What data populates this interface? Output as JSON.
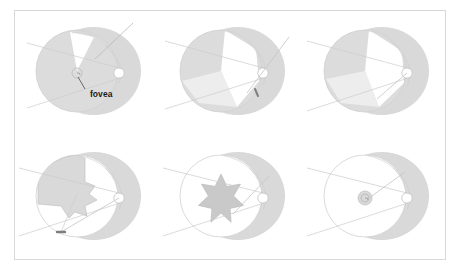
{
  "figure": {
    "caption_label": "",
    "border_color": "#d8d8d8",
    "background_color": "#ffffff",
    "panel_count": 6,
    "rows": 2,
    "columns": 3
  },
  "palette": {
    "globe_outline": "#cfcfcf",
    "shaded_fill": "#dcdcdc",
    "mid_fill": "#e8e8e8",
    "light_fill": "#f2f2f2",
    "white_fill": "#ffffff",
    "lens_outline": "#d0d0d0",
    "ray_line": "#cccccc",
    "dark_marker": "#8a8a8a",
    "label_text": "#1d1d1d"
  },
  "labels": {
    "fovea": "fovea"
  },
  "panels": [
    {
      "id": "panel-1",
      "name": "panel-top-left",
      "position": "top-left",
      "has_fovea_label": true,
      "fovea_label": "fovea",
      "shading": "full-globe-shaded",
      "defect_shape": "small-superior-wedge",
      "defect_fill": "#ffffff",
      "fovea_marker": "spiral-ring",
      "lens_marker": "small-circle-right",
      "ray_count": 3
    },
    {
      "id": "panel-2",
      "name": "panel-top-center",
      "position": "top-center",
      "has_fovea_label": false,
      "fovea_label": "",
      "shading": "partial-globe-shaded",
      "defect_shape": "large-central-wedge",
      "defect_fill": "#ffffff",
      "fovea_marker": "dark-dot",
      "lens_marker": "small-circle-right",
      "ray_count": 3
    },
    {
      "id": "panel-3",
      "name": "panel-top-right",
      "position": "top-right",
      "has_fovea_label": false,
      "fovea_label": "",
      "shading": "partial-globe-shaded",
      "defect_shape": "large-central-wedge",
      "defect_fill": "#ffffff",
      "fovea_marker": "none",
      "lens_marker": "small-circle-right",
      "ray_count": 2
    },
    {
      "id": "panel-4",
      "name": "panel-bottom-left",
      "position": "bottom-left",
      "has_fovea_label": false,
      "fovea_label": "",
      "shading": "upper-hemifield-shaded",
      "defect_shape": "star-notched-wedge",
      "defect_fill": "#dedede",
      "fovea_marker": "dark-dot-inferior",
      "lens_marker": "small-circle-right",
      "ray_count": 3
    },
    {
      "id": "panel-5",
      "name": "panel-bottom-center",
      "position": "bottom-center",
      "has_fovea_label": false,
      "fovea_label": "",
      "shading": "globe-outline-only",
      "defect_shape": "seven-point-star",
      "defect_fill": "#c9c9c9",
      "fovea_marker": "none",
      "lens_marker": "small-circle-right",
      "ray_count": 2
    },
    {
      "id": "panel-6",
      "name": "panel-bottom-right",
      "position": "bottom-right",
      "has_fovea_label": false,
      "fovea_label": "",
      "shading": "globe-outline-only",
      "defect_shape": "small-central-disc",
      "defect_fill": "#d9d9d9",
      "fovea_marker": "spiral-ring",
      "lens_marker": "small-circle-right",
      "ray_count": 2
    }
  ]
}
